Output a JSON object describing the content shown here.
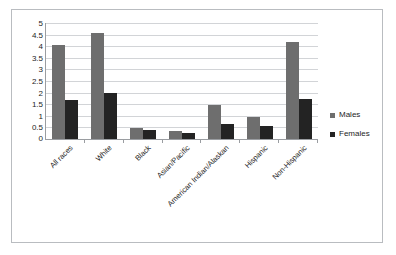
{
  "chart_data": {
    "type": "bar",
    "title": "",
    "subtitle": "",
    "xlabel": "",
    "ylabel": "",
    "grid": true,
    "legend_position": "right",
    "ylim": [
      0,
      5
    ],
    "ytick_labels": [
      "5",
      "4.5",
      "4",
      "3.5",
      "3",
      "2.5",
      "2",
      "1.5",
      "1",
      "0.5",
      "0"
    ],
    "ytick_values": [
      5,
      4.5,
      4,
      3.5,
      3,
      2.5,
      2,
      1.5,
      1,
      0.5,
      0
    ],
    "categories": [
      "All races",
      "White",
      "Black",
      "Asian/Pacific",
      "American Indian/Alaskan",
      "Hispanic",
      "Non-Hispanic"
    ],
    "series": [
      {
        "name": "Males",
        "color": "#6e6e6e",
        "values": [
          4.05,
          4.55,
          0.48,
          0.35,
          1.47,
          0.97,
          4.2
        ]
      },
      {
        "name": "Females",
        "color": "#232323",
        "values": [
          1.68,
          1.97,
          0.37,
          0.27,
          0.65,
          0.55,
          1.72
        ]
      }
    ]
  },
  "legend": {
    "items": [
      {
        "label": "Males",
        "color": "#6e6e6e"
      },
      {
        "label": "Females",
        "color": "#232323"
      }
    ]
  },
  "colors": {
    "males": "#6e6e6e",
    "females": "#232323",
    "gridline": "#d2d4d7",
    "axis": "#9a9da1",
    "frame_border": "#b9bcc0",
    "background": "#ffffff",
    "text": "#1d1d1d"
  }
}
